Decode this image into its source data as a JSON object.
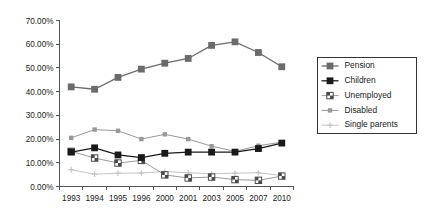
{
  "chart_data": {
    "type": "line",
    "title": "",
    "xlabel": "",
    "ylabel": "",
    "categories": [
      "1993",
      "1994",
      "1995",
      "1996",
      "2000",
      "2001",
      "2003",
      "2005",
      "2007",
      "2010"
    ],
    "ylim": [
      0,
      70
    ],
    "ytick_values": [
      0,
      10,
      20,
      30,
      40,
      50,
      60,
      70
    ],
    "ytick_labels": [
      "0.00%",
      "10.00%",
      "20.00%",
      "30.00%",
      "40.00%",
      "50.00%",
      "60.00%",
      "70.00%"
    ],
    "grid": false,
    "legend_position": "right",
    "series": [
      {
        "name": "Pension",
        "color": "#6b6b6b",
        "marker": "square",
        "values": [
          42.0,
          41.0,
          46.0,
          49.5,
          52.0,
          54.0,
          59.5,
          61.0,
          56.5,
          50.5
        ]
      },
      {
        "name": "Children",
        "color": "#1a1a1a",
        "marker": "square",
        "values": [
          14.5,
          16.3,
          13.3,
          12.2,
          14.0,
          14.5,
          14.5,
          14.5,
          16.0,
          18.3
        ]
      },
      {
        "name": "Unemployed",
        "color": "#9a9a9a",
        "marker": "checkered-square",
        "values": [
          14.8,
          12.0,
          9.9,
          11.0,
          4.9,
          3.6,
          4.0,
          2.9,
          2.6,
          4.4
        ]
      },
      {
        "name": "Disabled",
        "color": "#999999",
        "marker": "small-square",
        "values": [
          20.5,
          24.0,
          23.5,
          20.0,
          22.0,
          20.0,
          17.0,
          14.8,
          17.2,
          18.7
        ]
      },
      {
        "name": "Single parents",
        "color": "#c4c4c4",
        "marker": "cross",
        "values": [
          7.1,
          5.2,
          5.6,
          5.7,
          6.3,
          5.8,
          5.4,
          5.6,
          5.8,
          4.6
        ]
      }
    ]
  },
  "legend": {
    "items": [
      {
        "label": "Pension"
      },
      {
        "label": "Children"
      },
      {
        "label": "Unemployed"
      },
      {
        "label": "Disabled"
      },
      {
        "label": "Single parents"
      }
    ]
  }
}
